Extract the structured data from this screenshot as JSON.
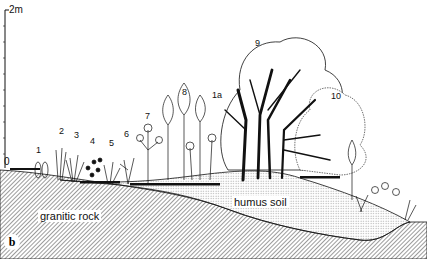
{
  "figure": {
    "panel_label": "b",
    "scale": {
      "top_label": "2m",
      "bottom_label": "0"
    },
    "ground": {
      "rock_label": "granitic  rock",
      "soil_label": "humus  soil"
    },
    "species_labels": [
      {
        "id": "1",
        "x": 37,
        "y": 147
      },
      {
        "id": "2",
        "x": 60,
        "y": 128
      },
      {
        "id": "3",
        "x": 75,
        "y": 132
      },
      {
        "id": "4",
        "x": 91,
        "y": 138
      },
      {
        "id": "5",
        "x": 110,
        "y": 140
      },
      {
        "id": "6",
        "x": 125,
        "y": 131
      },
      {
        "id": "7",
        "x": 146,
        "y": 113
      },
      {
        "id": "8",
        "x": 183,
        "y": 89
      },
      {
        "id": "1a",
        "x": 214,
        "y": 92
      },
      {
        "id": "9",
        "x": 256,
        "y": 40
      },
      {
        "id": "10",
        "x": 333,
        "y": 93
      }
    ],
    "colors": {
      "ink": "#111111",
      "background": "#ffffff"
    }
  }
}
